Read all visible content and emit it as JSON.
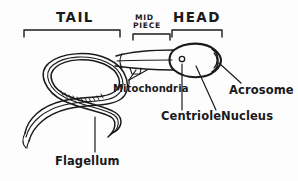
{
  "figure": {
    "background_color": "#fdfdfd",
    "ink_color": "#1a1a1a"
  },
  "region_labels": [
    {
      "id": "tail",
      "text": "TAIL",
      "x": 56,
      "y": 22
    },
    {
      "id": "mid-piece",
      "text_line1": "MID",
      "text_line2": "PIECE",
      "x": 135,
      "y": 23
    },
    {
      "id": "head",
      "text": "HEAD",
      "x": 173,
      "y": 22
    }
  ],
  "brackets": [
    {
      "id": "tail-bracket",
      "x1": 24,
      "x2": 120,
      "y": 30,
      "tick": 7
    },
    {
      "id": "mid-bracket",
      "x1": 133,
      "x2": 170,
      "y": 34,
      "tick": 6
    },
    {
      "id": "head-bracket",
      "x1": 172,
      "x2": 222,
      "y": 30,
      "tick": 7
    }
  ],
  "organelle_labels": [
    {
      "id": "mitochondria",
      "text": "Mitochondria",
      "x": 113,
      "y": 90
    },
    {
      "id": "acrosome",
      "text": "Acrosome",
      "x": 229,
      "y": 92
    },
    {
      "id": "centriole",
      "text": "Centriole",
      "x": 163,
      "y": 119
    },
    {
      "id": "nucleus",
      "text": "Nucleus",
      "x": 223,
      "y": 119
    },
    {
      "id": "flagellum",
      "text": "Flagellum",
      "x": 56,
      "y": 163
    }
  ],
  "parts": [
    {
      "id": "head-oval",
      "name": "head",
      "cx": 197,
      "cy": 60,
      "rx": 25,
      "ry": 16
    },
    {
      "id": "acrosome-cap",
      "name": "acrosome",
      "cx": 217,
      "cy": 60
    },
    {
      "id": "centriole-dot",
      "name": "centriole",
      "cx": 182,
      "cy": 59,
      "r": 2.6
    },
    {
      "id": "midpiece-tube",
      "name": "mid piece",
      "x1": 118,
      "x2": 172
    },
    {
      "id": "tail-flagellum",
      "name": "flagellum",
      "shape": "s-curve"
    }
  ]
}
